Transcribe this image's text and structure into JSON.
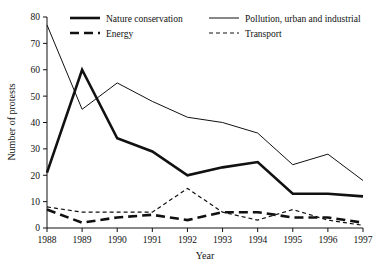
{
  "chart_data": {
    "type": "line",
    "title": "",
    "xlabel": "Year",
    "ylabel": "Number of protests",
    "categories": [
      "1988",
      "1989",
      "1990",
      "1991",
      "1992",
      "1993",
      "1994",
      "1995",
      "1996",
      "1997"
    ],
    "x": [
      1988,
      1989,
      1990,
      1991,
      1992,
      1993,
      1994,
      1995,
      1996,
      1997
    ],
    "xlim": [
      1988,
      1997
    ],
    "ylim": [
      0,
      80
    ],
    "yticks": [
      0,
      10,
      20,
      30,
      40,
      50,
      60,
      70,
      80
    ],
    "grid": false,
    "legend_position": "top",
    "series": [
      {
        "name": "Nature conservation",
        "style": "thick-solid",
        "values": [
          21,
          60,
          34,
          29,
          20,
          23,
          25,
          13,
          13,
          12
        ]
      },
      {
        "name": "Pollution, urban and industrial",
        "style": "thin-solid",
        "values": [
          77,
          45,
          55,
          48,
          42,
          40,
          36,
          24,
          28,
          18
        ]
      },
      {
        "name": "Energy",
        "style": "thick-dashed",
        "values": [
          7,
          2,
          4,
          5,
          3,
          6,
          6,
          4,
          4,
          2
        ]
      },
      {
        "name": "Transport",
        "style": "thin-dotted",
        "values": [
          8,
          6,
          6,
          6,
          15,
          6,
          3,
          7,
          3,
          1
        ]
      }
    ]
  },
  "legend": {
    "entries": [
      {
        "label": "Nature conservation"
      },
      {
        "label": "Pollution, urban and industrial"
      },
      {
        "label": "Energy"
      },
      {
        "label": "Transport"
      }
    ]
  }
}
